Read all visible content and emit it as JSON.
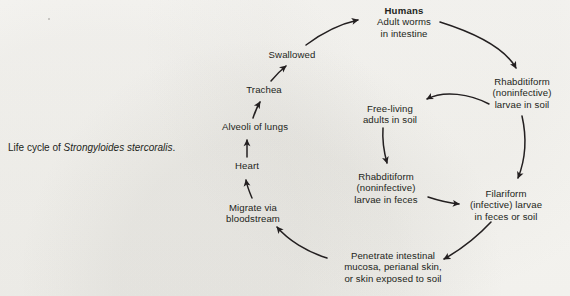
{
  "figure": {
    "caption_prefix": "Life cycle of ",
    "caption_species": "Strongyloides stercoralis",
    "caption_suffix": "."
  },
  "diagram": {
    "type": "cycle-flow",
    "nodes": {
      "humans": {
        "heading": "Humans",
        "line1": "Adult worms",
        "line2": "in intestine"
      },
      "rhabditiform_soil": {
        "line1": "Rhabditiform",
        "line2": "(noninfective)",
        "line3": "larvae in soil"
      },
      "filariform": {
        "line1": "Filariform",
        "line2": "(infective) larvae",
        "line3": "in feces or soil"
      },
      "penetrate": {
        "line1": "Penetrate intestinal",
        "line2": "mucosa, perianal skin,",
        "line3": "or skin exposed to soil"
      },
      "migrate": {
        "line1": "Migrate via",
        "line2": "bloodstream"
      },
      "heart": {
        "line1": "Heart"
      },
      "alveoli": {
        "line1": "Alveoli of lungs"
      },
      "trachea": {
        "line1": "Trachea"
      },
      "swallowed": {
        "line1": "Swallowed"
      },
      "free_living": {
        "line1": "Free-living",
        "line2": "adults in soil"
      },
      "rhabditiform_feces": {
        "line1": "Rhabditiform",
        "line2": "(noninfective)",
        "line3": "larvae in feces"
      }
    },
    "edges": [
      {
        "from": "humans",
        "to": "rhabditiform_soil"
      },
      {
        "from": "rhabditiform_soil",
        "to": "free_living"
      },
      {
        "from": "rhabditiform_soil",
        "to": "filariform"
      },
      {
        "from": "free_living",
        "to": "rhabditiform_feces"
      },
      {
        "from": "rhabditiform_feces",
        "to": "filariform"
      },
      {
        "from": "filariform",
        "to": "penetrate"
      },
      {
        "from": "penetrate",
        "to": "migrate"
      },
      {
        "from": "migrate",
        "to": "heart"
      },
      {
        "from": "heart",
        "to": "alveoli"
      },
      {
        "from": "alveoli",
        "to": "trachea"
      },
      {
        "from": "trachea",
        "to": "swallowed"
      },
      {
        "from": "swallowed",
        "to": "humans"
      }
    ]
  },
  "colors": {
    "ink": "#231f20",
    "paper": "#f6f5f2"
  }
}
